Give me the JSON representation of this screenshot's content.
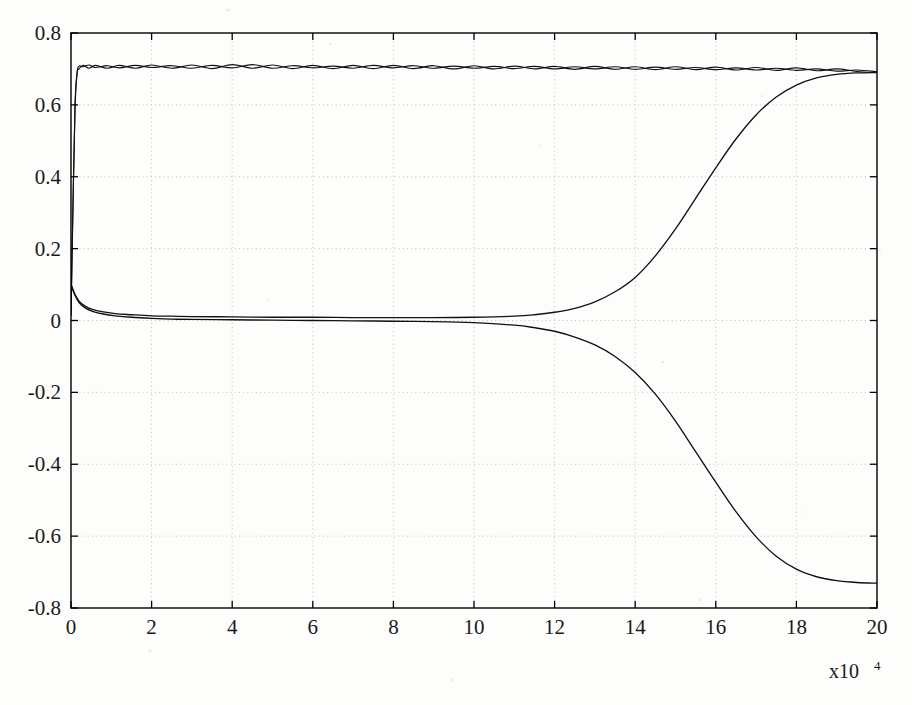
{
  "chart_data": {
    "type": "line",
    "title": "",
    "subtitle": "",
    "xlabel": "",
    "ylabel": "",
    "x_multiplier": "x10",
    "x_multiplier_exponent": "4",
    "xlim": [
      0,
      20
    ],
    "ylim": [
      -0.8,
      0.8
    ],
    "xticks": [
      0,
      2,
      4,
      6,
      8,
      10,
      12,
      14,
      16,
      18,
      20
    ],
    "xtick_labels": [
      "0",
      "2",
      "4",
      "6",
      "8",
      "10",
      "12",
      "14",
      "16",
      "18",
      "20"
    ],
    "yticks": [
      -0.8,
      -0.6,
      -0.4,
      -0.2,
      0,
      0.2,
      0.4,
      0.6,
      0.8
    ],
    "ytick_labels": [
      "-0.8",
      "-0.6",
      "-0.4",
      "-0.2",
      "0",
      "0.2",
      "0.4",
      "0.6",
      "0.8"
    ],
    "grid": true,
    "grid_style": "dotted",
    "grid_color": "#b9b9b9",
    "legend": false,
    "legend_position": "none",
    "background_color": "#fdfdfb",
    "line_color": "#111111",
    "series": [
      {
        "name": "upper-band-line-a",
        "description": "Upper oscillating line, rises steeply from ~0 at x=0 to plateau ~0.705, slowly drifting down to ~0.690",
        "x": [
          0.0,
          0.05,
          0.1,
          0.15,
          0.2,
          0.3,
          0.45,
          0.6,
          0.9,
          1.2,
          1.6,
          2.0,
          2.5,
          3.0,
          3.5,
          4.0,
          4.5,
          5.0,
          5.5,
          6.0,
          6.5,
          7.0,
          7.5,
          8.0,
          8.5,
          9.0,
          9.5,
          10.0,
          10.5,
          11.0,
          11.5,
          12.0,
          12.5,
          13.0,
          13.5,
          14.0,
          14.5,
          15.0,
          15.5,
          16.0,
          16.5,
          17.0,
          17.5,
          18.0,
          18.5,
          19.0,
          19.5,
          20.0
        ],
        "y": [
          0.015,
          0.33,
          0.6,
          0.69,
          0.708,
          0.706,
          0.711,
          0.704,
          0.709,
          0.703,
          0.71,
          0.704,
          0.709,
          0.702,
          0.71,
          0.703,
          0.712,
          0.702,
          0.709,
          0.703,
          0.708,
          0.702,
          0.71,
          0.703,
          0.709,
          0.702,
          0.708,
          0.702,
          0.707,
          0.701,
          0.707,
          0.7,
          0.706,
          0.7,
          0.706,
          0.699,
          0.705,
          0.699,
          0.704,
          0.698,
          0.703,
          0.697,
          0.702,
          0.696,
          0.7,
          0.694,
          0.697,
          0.692
        ]
      },
      {
        "name": "upper-band-line-b",
        "description": "Second upper line nearly coincident with line-a, anti-phase oscillation creating lens/diamond shapes",
        "x": [
          0.0,
          0.05,
          0.1,
          0.15,
          0.2,
          0.3,
          0.45,
          0.6,
          0.9,
          1.2,
          1.6,
          2.0,
          2.5,
          3.0,
          3.5,
          4.0,
          4.5,
          5.0,
          5.5,
          6.0,
          6.5,
          7.0,
          7.5,
          8.0,
          8.5,
          9.0,
          9.5,
          10.0,
          10.5,
          11.0,
          11.5,
          12.0,
          12.5,
          13.0,
          13.5,
          14.0,
          14.5,
          15.0,
          15.5,
          16.0,
          16.5,
          17.0,
          17.5,
          18.0,
          18.5,
          19.0,
          19.5,
          20.0
        ],
        "y": [
          0.015,
          0.32,
          0.59,
          0.686,
          0.7,
          0.71,
          0.702,
          0.71,
          0.702,
          0.71,
          0.702,
          0.711,
          0.702,
          0.711,
          0.701,
          0.712,
          0.702,
          0.711,
          0.701,
          0.71,
          0.701,
          0.71,
          0.701,
          0.71,
          0.701,
          0.709,
          0.7,
          0.709,
          0.7,
          0.708,
          0.7,
          0.707,
          0.699,
          0.707,
          0.699,
          0.706,
          0.698,
          0.706,
          0.698,
          0.705,
          0.697,
          0.704,
          0.696,
          0.703,
          0.695,
          0.7,
          0.693,
          0.69
        ]
      },
      {
        "name": "rising-sigmoid",
        "description": "Starts ~0.10 at x=0, decays toward 0 by x=2, stays near 0.005 until x~12, then rises as a sigmoid crossing 0.35 near x=16 and saturating at ~0.69 by x=19",
        "x": [
          0.0,
          0.1,
          0.2,
          0.35,
          0.55,
          0.8,
          1.1,
          1.5,
          2.0,
          2.5,
          3.0,
          4.0,
          5.0,
          6.0,
          7.0,
          8.0,
          9.0,
          10.0,
          11.0,
          11.5,
          12.0,
          12.5,
          13.0,
          13.5,
          14.0,
          14.5,
          15.0,
          15.5,
          16.0,
          16.5,
          17.0,
          17.5,
          18.0,
          18.5,
          19.0,
          19.5,
          20.0
        ],
        "y": [
          0.1,
          0.072,
          0.054,
          0.04,
          0.03,
          0.024,
          0.019,
          0.016,
          0.013,
          0.012,
          0.011,
          0.01,
          0.009,
          0.009,
          0.008,
          0.008,
          0.008,
          0.009,
          0.012,
          0.016,
          0.023,
          0.034,
          0.052,
          0.08,
          0.12,
          0.18,
          0.255,
          0.34,
          0.425,
          0.505,
          0.572,
          0.622,
          0.655,
          0.675,
          0.685,
          0.689,
          0.69
        ]
      },
      {
        "name": "falling-sigmoid",
        "description": "Mirror of rising branch: hugs 0 until x~12 then descends, crossing -0.35 near x=16 and flattening at about -0.73 by x=19",
        "x": [
          0.0,
          0.1,
          0.2,
          0.35,
          0.55,
          0.8,
          1.1,
          1.5,
          2.0,
          2.5,
          3.0,
          4.0,
          5.0,
          6.0,
          7.0,
          8.0,
          9.0,
          10.0,
          11.0,
          11.5,
          12.0,
          12.5,
          13.0,
          13.5,
          14.0,
          14.5,
          15.0,
          15.5,
          16.0,
          16.5,
          17.0,
          17.5,
          18.0,
          18.5,
          19.0,
          19.5,
          20.0
        ],
        "y": [
          0.1,
          0.07,
          0.05,
          0.035,
          0.025,
          0.018,
          0.013,
          0.009,
          0.006,
          0.004,
          0.003,
          0.002,
          0.001,
          0.0,
          -0.001,
          -0.002,
          -0.003,
          -0.006,
          -0.013,
          -0.02,
          -0.03,
          -0.046,
          -0.068,
          -0.1,
          -0.145,
          -0.205,
          -0.28,
          -0.365,
          -0.45,
          -0.532,
          -0.602,
          -0.656,
          -0.692,
          -0.713,
          -0.724,
          -0.729,
          -0.731
        ]
      }
    ]
  }
}
